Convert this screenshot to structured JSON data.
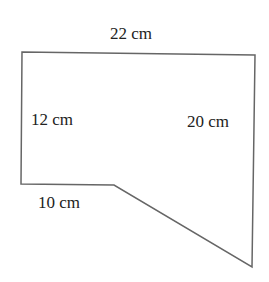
{
  "diagram": {
    "type": "composite-polygon",
    "stroke_color": "#666666",
    "fill_color": "#ffffff",
    "vertices": [
      {
        "x": 22,
        "y": 52
      },
      {
        "x": 255,
        "y": 55
      },
      {
        "x": 252,
        "y": 267
      },
      {
        "x": 114,
        "y": 185
      },
      {
        "x": 21,
        "y": 184
      }
    ],
    "labels": {
      "top": "22 cm",
      "left": "12 cm",
      "right": "20 cm",
      "bottom": "10 cm"
    }
  }
}
